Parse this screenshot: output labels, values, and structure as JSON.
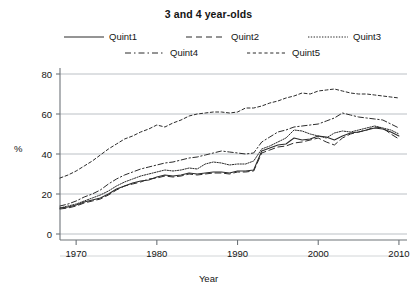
{
  "chart_data": {
    "type": "line",
    "title": "3 and 4 year-olds",
    "xlabel": "Year",
    "ylabel": "%",
    "xlim": [
      1968,
      2011
    ],
    "ylim": [
      0,
      88
    ],
    "yticks": [
      0,
      20,
      40,
      60,
      80
    ],
    "ytick_labels": [
      "0",
      "20",
      "40",
      "60",
      "80"
    ],
    "xticks": [
      1970,
      1980,
      1990,
      2000,
      2010
    ],
    "xtick_labels": [
      "1970",
      "1980",
      "1990",
      "2000",
      "2010"
    ],
    "grid": "horizontal",
    "legend_position": "top",
    "line_color": "#2b2b2b",
    "grid_color": "#aab0b6",
    "axis_color": "#6e7479",
    "x": [
      1968,
      1969,
      1970,
      1971,
      1972,
      1973,
      1974,
      1975,
      1976,
      1977,
      1978,
      1979,
      1980,
      1981,
      1982,
      1983,
      1984,
      1985,
      1986,
      1987,
      1988,
      1989,
      1990,
      1991,
      1992,
      1993,
      1994,
      1995,
      1996,
      1997,
      1998,
      1999,
      2000,
      2001,
      2002,
      2003,
      2004,
      2005,
      2006,
      2007,
      2008,
      2009,
      2010
    ],
    "series": [
      {
        "name": "Quint1",
        "dash": "solid",
        "values": [
          13,
          13.5,
          14.5,
          16,
          17,
          18,
          20,
          22.5,
          24,
          25.5,
          26.5,
          27,
          28.5,
          29.5,
          29,
          29.5,
          30.5,
          30,
          30.5,
          31,
          31,
          30.5,
          31.5,
          31.5,
          32,
          41.5,
          43,
          44.5,
          45,
          48,
          47,
          47.5,
          49,
          48.5,
          47,
          49,
          50.5,
          51,
          52,
          53,
          52.5,
          51,
          49
        ]
      },
      {
        "name": "Quint2",
        "dash": "dashed",
        "values": [
          12.5,
          13,
          14,
          15.5,
          16.5,
          17.5,
          19.5,
          22,
          24,
          25,
          26,
          27.5,
          28,
          29,
          28.5,
          29,
          30,
          29.5,
          30,
          30.5,
          30.5,
          30,
          31,
          31,
          31.5,
          40.5,
          42,
          43.5,
          44,
          45.5,
          46,
          47,
          48,
          46,
          44.5,
          48,
          50,
          51,
          52,
          53.5,
          53,
          50,
          47.5
        ]
      },
      {
        "name": "Quint3",
        "dash": "dotted",
        "values": [
          13,
          14,
          15,
          16.5,
          18,
          19.5,
          21.5,
          24,
          26,
          27.5,
          29,
          30,
          31,
          32,
          31.5,
          32,
          33,
          32.5,
          35,
          36,
          35.5,
          34.5,
          35,
          35,
          36.5,
          42.5,
          44,
          46,
          48,
          52,
          51.5,
          50,
          49,
          48,
          50.5,
          51.5,
          51,
          52,
          53,
          54,
          53,
          52,
          50
        ]
      },
      {
        "name": "Quint4",
        "dash": "dashdot",
        "values": [
          14,
          15,
          16.5,
          18.5,
          20,
          22,
          25,
          27.5,
          29.5,
          31,
          32.5,
          33.5,
          34.5,
          35.5,
          36,
          37,
          38,
          38.5,
          39.5,
          40.5,
          41.5,
          41,
          40.5,
          40,
          40.5,
          46,
          48.5,
          51,
          52,
          53.5,
          54,
          54.5,
          55,
          56.5,
          58,
          60.5,
          59.5,
          58.5,
          58,
          57.5,
          57,
          55,
          53
        ]
      },
      {
        "name": "Quint5",
        "dash": "shortdash",
        "values": [
          28,
          29.5,
          31.5,
          34,
          36.5,
          39.5,
          42.5,
          45,
          47.5,
          49,
          51,
          52.5,
          54.5,
          53.5,
          55.5,
          57,
          59,
          60,
          60.5,
          61,
          61,
          60.5,
          61,
          63,
          63,
          64,
          65.5,
          66.5,
          68,
          69,
          70.5,
          70,
          71.5,
          72,
          72.5,
          71.5,
          70.5,
          70,
          70,
          69.5,
          69,
          68.5,
          68
        ]
      }
    ]
  }
}
